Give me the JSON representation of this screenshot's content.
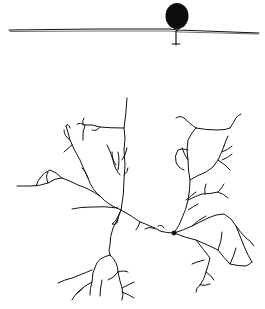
{
  "figure": {
    "background": "#ffffff",
    "ink_color": "#111111",
    "top_panel": {
      "description": "horizontal line with a filled round body (balloon-like) resting on it, small stem below",
      "line": {
        "x1": 9,
        "y1": 30,
        "x2": 259,
        "y2": 33
      },
      "ball": {
        "cx": 177,
        "cy": 17,
        "r": 12
      }
    },
    "bottom_panel": {
      "description": "branching dendritic tree drawing with two main arbors joined by a central process",
      "soma": {
        "cx": 174,
        "cy": 233,
        "r": 2
      }
    }
  }
}
